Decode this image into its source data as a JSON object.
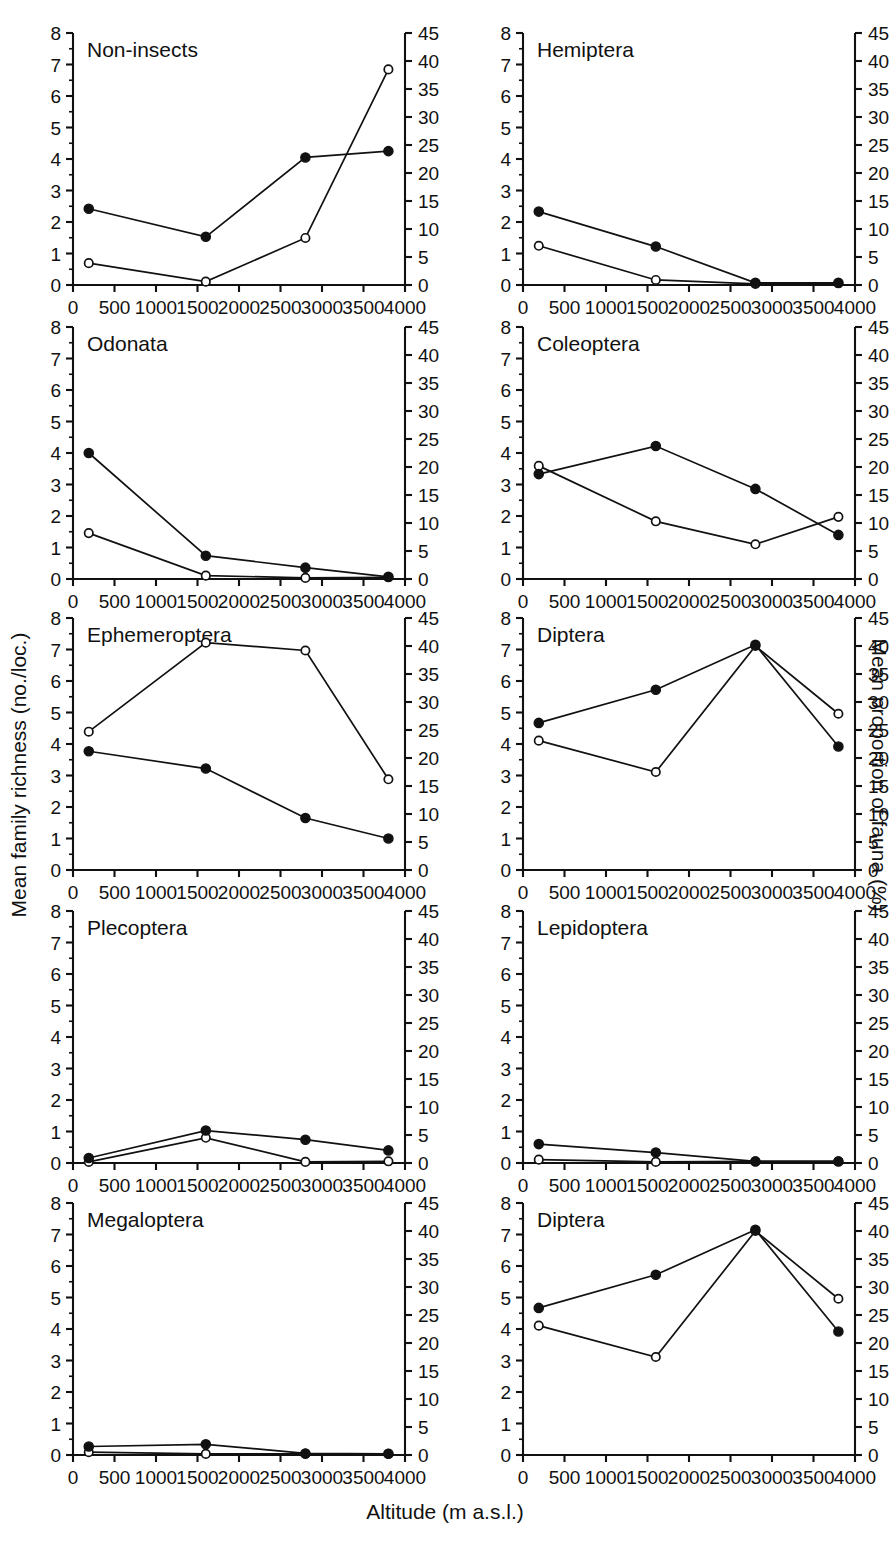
{
  "figure": {
    "xlabel": "Altitude (m a.s.l.)",
    "ylabel_left": "Mean family richness (no./loc.)",
    "ylabel_right": "Mean proportion of fauna (%)"
  },
  "axes": {
    "x_ticks": [
      "0",
      "500",
      "1000",
      "1500",
      "2000",
      "2500",
      "3000",
      "3500",
      "4000"
    ],
    "x_tick_values": [
      0,
      500,
      1000,
      1500,
      2000,
      2500,
      3000,
      3500,
      4000
    ],
    "xlim": [
      0,
      4000
    ],
    "y_left_ticks": [
      "0",
      "1",
      "2",
      "3",
      "4",
      "5",
      "6",
      "7",
      "8"
    ],
    "y_left_tick_values": [
      0,
      1,
      2,
      3,
      4,
      5,
      6,
      7,
      8
    ],
    "ylim_left": [
      0,
      8
    ],
    "y_right_ticks": [
      "0",
      "5",
      "10",
      "15",
      "20",
      "25",
      "30",
      "35",
      "40",
      "45"
    ],
    "y_right_tick_values": [
      0,
      5,
      10,
      15,
      20,
      25,
      30,
      35,
      40,
      45
    ],
    "ylim_right": [
      0,
      45
    ]
  },
  "chart_data": {
    "type": "line",
    "title": "",
    "xlabel": "Altitude (m a.s.l.)",
    "ylabel": "Mean family richness (no./loc.)",
    "ylabel_secondary": "Mean proportion of fauna (%)",
    "xlim": [
      0,
      4000
    ],
    "ylim": [
      0,
      8
    ],
    "ylim_secondary": [
      0,
      45
    ],
    "grid": false,
    "legend": "none",
    "x": [
      190,
      1600,
      2800,
      3800
    ],
    "series_definitions": [
      {
        "name": "Mean family richness (no./loc.)",
        "marker": "filled-circle",
        "axis": "left"
      },
      {
        "name": "Mean proportion of fauna (%)",
        "marker": "open-circle",
        "axis": "right"
      }
    ],
    "panels": [
      {
        "title": "Non-insects",
        "richness": [
          2.42,
          1.53,
          4.05,
          4.25
        ],
        "proportion": [
          3.9,
          0.6,
          8.4,
          38.5
        ]
      },
      {
        "title": "Hemiptera",
        "richness": [
          2.33,
          1.22,
          0.07,
          0.07
        ],
        "proportion": [
          7.0,
          0.9,
          0.2,
          0.3
        ]
      },
      {
        "title": "Odonata",
        "richness": [
          4.0,
          0.74,
          0.36,
          0.07
        ],
        "proportion": [
          8.2,
          0.6,
          0.2,
          0.3
        ]
      },
      {
        "title": "Coleoptera",
        "richness": [
          3.33,
          4.22,
          2.86,
          1.4
        ],
        "proportion": [
          20.2,
          10.3,
          6.2,
          11.1
        ]
      },
      {
        "title": "Ephemeroptera",
        "richness": [
          3.77,
          3.22,
          1.65,
          1.0
        ],
        "proportion": [
          24.7,
          40.6,
          39.2,
          16.2
        ]
      },
      {
        "title": "Diptera",
        "richness": [
          4.67,
          5.72,
          7.15,
          3.92
        ],
        "proportion": [
          23.1,
          17.5,
          40.0,
          27.9
        ]
      },
      {
        "title": "Plecoptera",
        "richness": [
          0.16,
          1.03,
          0.74,
          0.4
        ],
        "proportion": [
          0.2,
          4.5,
          0.2,
          0.3
        ]
      },
      {
        "title": "Lepidoptera",
        "richness": [
          0.6,
          0.33,
          0.05,
          0.05
        ],
        "proportion": [
          0.6,
          0.2,
          0.3,
          0.3
        ]
      },
      {
        "title": "Megaloptera",
        "richness": [
          0.27,
          0.34,
          0.05,
          0.04
        ],
        "proportion": [
          0.5,
          0.2,
          0.2,
          0.2
        ]
      },
      {
        "title": "Diptera",
        "richness": [
          4.67,
          5.72,
          7.15,
          3.92
        ],
        "proportion": [
          23.1,
          17.5,
          40.0,
          27.9
        ]
      }
    ]
  }
}
